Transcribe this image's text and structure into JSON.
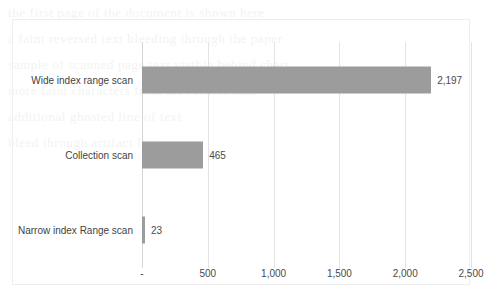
{
  "chart_data": {
    "type": "bar",
    "orientation": "horizontal",
    "title": "",
    "subtitle": "",
    "xlabel": "",
    "ylabel": "",
    "categories": [
      "Wide index range scan",
      "Collection scan",
      "Narrow index Range scan"
    ],
    "values": [
      2197,
      465,
      23
    ],
    "value_labels": [
      "2,197",
      "465",
      "23"
    ],
    "xlim": [
      0,
      2500
    ],
    "xticks": [
      0,
      500,
      1000,
      1500,
      2000,
      2500
    ],
    "xtick_labels": [
      "-",
      "500",
      "1,000",
      "1,500",
      "2,000",
      "2,500"
    ],
    "grid": "vertical",
    "legend": "none",
    "series": [
      {
        "name": "",
        "values": [
          2197,
          465,
          23
        ]
      }
    ],
    "colors": {
      "bar": "#9c9c9c",
      "gridline": "#e3e3e3",
      "frame": "#eeeeee",
      "text": "#3f3f3f"
    }
  },
  "background_bleed": [
    "the first page of the document is shown here",
    "a faint reversed text bleeding through the paper",
    "",
    "sample of scanned page text visible behind chart",
    "",
    "more faint characters from the reverse side",
    "",
    "additional ghosted line of text",
    "",
    "bleed through artifact line",
    ""
  ]
}
